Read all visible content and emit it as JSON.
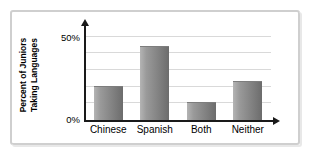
{
  "chart_data": {
    "type": "bar",
    "title": "",
    "xlabel": "",
    "ylabel": "Percent of Juniors Taking Languages",
    "ylabel_line1": "Percent of Juniors",
    "ylabel_line2": "Taking Languages",
    "categories": [
      "Chinese",
      "Spanish",
      "Both",
      "Neither"
    ],
    "values": [
      20,
      44,
      10,
      23
    ],
    "ylim": [
      0,
      50
    ],
    "ytick_labels": [
      "0%",
      "50%"
    ],
    "ytick_values": [
      0,
      50
    ],
    "gridlines": [
      10,
      20,
      30,
      40,
      50
    ],
    "grid": true,
    "legend": "none",
    "bar_color_light": "#b4b4b4",
    "bar_color_dark": "#6c6c6c",
    "axis_color": "#1a1a1a",
    "gridline_color": "#d9d9d9",
    "frame_color": "#cfcfcf",
    "background": "#ffffff",
    "axis_arrows": true
  }
}
